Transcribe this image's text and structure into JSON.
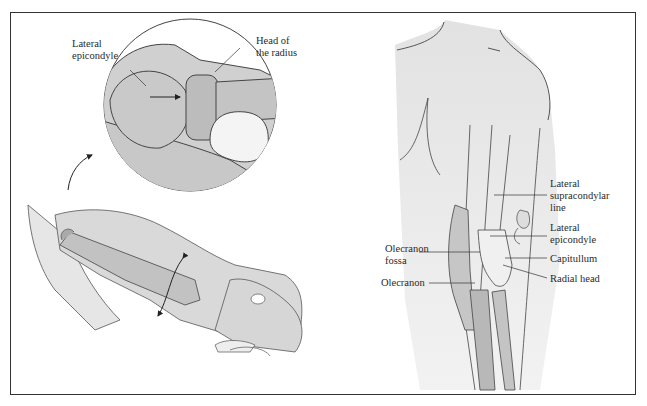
{
  "figure": {
    "left_panel": {
      "inset_labels": {
        "lateral_epicondyle": "Lateral\nepicondyle",
        "head_of_radius": "Head of\nthe radius"
      },
      "arrows": [
        "curved-pointer-arrow",
        "rotation-double-arrow",
        "inset-pointer-arrow"
      ]
    },
    "right_panel": {
      "labels": {
        "lateral_supracondylar_line": "Lateral\nsupracondylar\nline",
        "lateral_epicondyle": "Lateral\nepicondyle",
        "capitullum": "Capitullum",
        "radial_head": "Radial head",
        "olecranon_fossa": "Olecranon\nfossa",
        "olecranon": "Olecranon"
      }
    },
    "colors": {
      "skin": "#d9d9d9",
      "bone": "#bdbdbd",
      "bone_dark": "#a8a8a8",
      "outline": "#444444",
      "highlight": "#f4f4f4",
      "border": "#333333"
    }
  }
}
